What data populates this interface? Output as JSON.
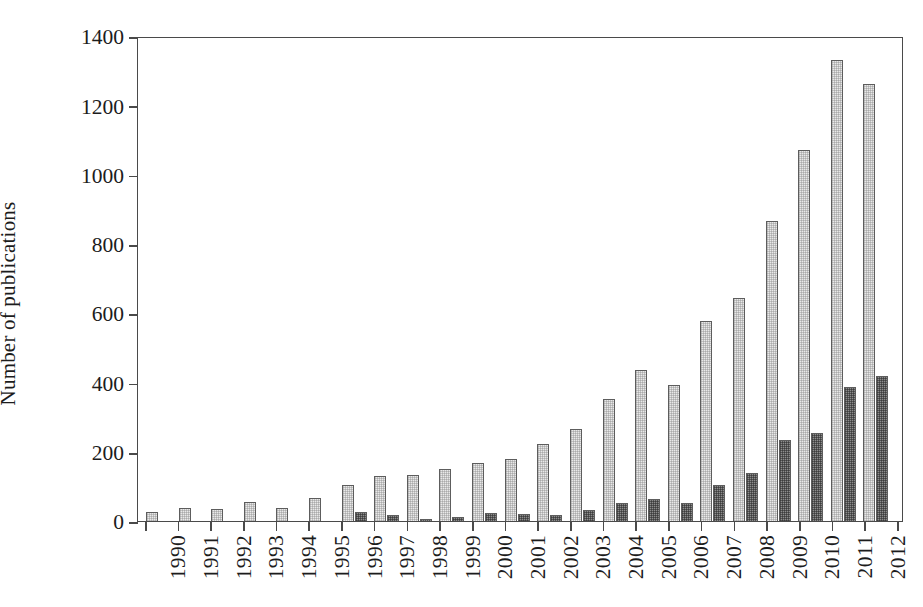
{
  "chart_data": {
    "type": "bar",
    "title": "",
    "xlabel": "",
    "ylabel": "Number of publications",
    "ylim": [
      0,
      1400
    ],
    "yticks": [
      0,
      200,
      400,
      600,
      800,
      1000,
      1200,
      1400
    ],
    "grid": false,
    "legend": "none",
    "categories": [
      "1990",
      "1991",
      "1992",
      "1993",
      "1994",
      "1995",
      "1996",
      "1997",
      "1998",
      "1999",
      "2000",
      "2001",
      "2002",
      "2003",
      "2004",
      "2005",
      "2006",
      "2007",
      "2008",
      "2009",
      "2010",
      "2011",
      "2012"
    ],
    "series": [
      {
        "name": "light-series",
        "color": "#e9e9e9",
        "values": [
          25,
          38,
          36,
          55,
          38,
          65,
          105,
          130,
          132,
          150,
          168,
          178,
          222,
          265,
          352,
          435,
          394,
          576,
          643,
          866,
          1070,
          1330,
          1262
        ]
      },
      {
        "name": "dark-series",
        "color": "#8d8d8d",
        "values": [
          0,
          0,
          0,
          0,
          0,
          0,
          25,
          16,
          5,
          13,
          22,
          20,
          18,
          33,
          52,
          63,
          52,
          105,
          140,
          233,
          255,
          387,
          418
        ]
      }
    ]
  },
  "axes": {
    "y_tick_labels": [
      "1400",
      "1200",
      "1000",
      "800",
      "600",
      "400",
      "200",
      "0"
    ],
    "y_axis_title": "Number of publications"
  }
}
